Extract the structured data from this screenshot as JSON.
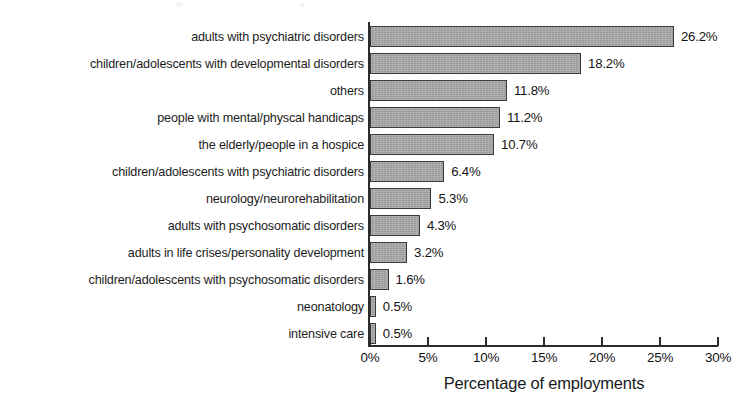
{
  "chart_data": {
    "type": "bar",
    "orientation": "horizontal",
    "title": "",
    "xlabel": "Percentage of employments",
    "ylabel": "",
    "xlim": [
      0,
      30
    ],
    "xticks": [
      0,
      5,
      10,
      15,
      20,
      25,
      30
    ],
    "xtick_labels": [
      "0%",
      "5%",
      "10%",
      "15%",
      "20%",
      "25%",
      "30%"
    ],
    "grid": false,
    "legend": null,
    "value_suffix": "%",
    "bar_color": "#a9a9a9",
    "bar_edge_color": "#3a3a3a",
    "axis_color": "#2b2b2b",
    "categories": [
      "adults with psychiatric disorders",
      "children/adolescents with developmental disorders",
      "others",
      "people with mental/physcal handicaps",
      "the elderly/people in a hospice",
      "children/adolescents with psychiatric disorders",
      "neurology/neurorehabilitation",
      "adults with psychosomatic disorders",
      "adults in life crises/personality development",
      "children/adolescents with psychosomatic disorders",
      "neonatology",
      "intensive care"
    ],
    "values": [
      26.2,
      18.2,
      11.8,
      11.2,
      10.7,
      6.4,
      5.3,
      4.3,
      3.2,
      1.6,
      0.5,
      0.5
    ],
    "value_labels": [
      "26.2%",
      "18.2%",
      "11.8%",
      "11.2%",
      "10.7%",
      "6.4%",
      "5.3%",
      "4.3%",
      "3.2%",
      "1.6%",
      "0.5%",
      "0.5%"
    ]
  }
}
